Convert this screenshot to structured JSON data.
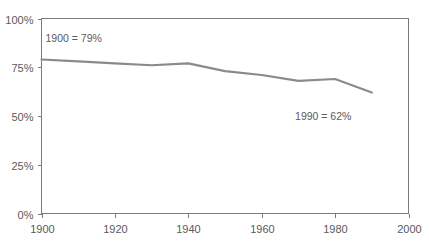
{
  "chart_data": {
    "type": "line",
    "title": "",
    "subtitle": "",
    "xlabel": "",
    "ylabel": "",
    "xlim": [
      1900,
      2000
    ],
    "ylim": [
      0,
      100
    ],
    "grid": false,
    "legend": "none",
    "x_ticks": [
      1900,
      1920,
      1940,
      1960,
      1980,
      2000
    ],
    "x_tick_labels": [
      "1900",
      "1920",
      "1940",
      "1960",
      "1980",
      "2000"
    ],
    "y_ticks": [
      0,
      25,
      50,
      75,
      100
    ],
    "y_tick_labels": [
      "0%",
      "25%",
      "50%",
      "75%",
      "100%"
    ],
    "series": [
      {
        "name": "percentage",
        "x": [
          1900,
          1910,
          1920,
          1930,
          1940,
          1950,
          1960,
          1970,
          1980,
          1990
        ],
        "values": [
          79,
          78,
          77,
          76,
          77,
          73,
          71,
          68,
          69,
          62
        ]
      }
    ],
    "annotations": [
      {
        "id": "start-annotation",
        "text": "1900 = 79%",
        "x": 1900,
        "y": 88
      },
      {
        "id": "end-annotation",
        "text": "1990 = 62%",
        "x": 1968,
        "y": 48
      }
    ],
    "line_color": "#8a8a8a",
    "axis_color": "#7a7a7a",
    "text_color": "#5a5a5a",
    "background_color": "#ffffff"
  }
}
